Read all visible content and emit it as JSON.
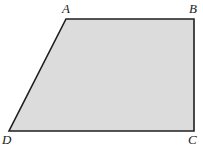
{
  "figure": {
    "name": "trapezoid-ABCD",
    "type": "geometric-quadrilateral",
    "background_color": "#ffffff",
    "fill_color": "#dcdcdc",
    "stroke_color": "#1f1f1f",
    "stroke_width": 1.6,
    "canvas": {
      "width": 203,
      "height": 150
    },
    "vertices": [
      {
        "id": "A",
        "label": "A",
        "x": 66,
        "y": 19,
        "label_x": 62,
        "label_y": 2
      },
      {
        "id": "B",
        "label": "B",
        "x": 194,
        "y": 19,
        "label_x": 189,
        "label_y": 2
      },
      {
        "id": "C",
        "label": "C",
        "x": 194,
        "y": 131,
        "label_x": 188,
        "label_y": 133
      },
      {
        "id": "D",
        "label": "D",
        "x": 9,
        "y": 131,
        "label_x": 2,
        "label_y": 133
      }
    ],
    "path": "M 66 19 L 194 19 L 194 131 L 9 131 Z",
    "edges": [
      {
        "id": "AB",
        "from": "A",
        "to": "B",
        "orientation": "horizontal-top"
      },
      {
        "id": "BC",
        "from": "B",
        "to": "C",
        "orientation": "vertical-right"
      },
      {
        "id": "CD",
        "from": "C",
        "to": "D",
        "orientation": "horizontal-bottom"
      },
      {
        "id": "DA",
        "from": "D",
        "to": "A",
        "orientation": "slanted-left"
      }
    ]
  },
  "labels": {
    "A": "A",
    "B": "B",
    "C": "C",
    "D": "D"
  }
}
